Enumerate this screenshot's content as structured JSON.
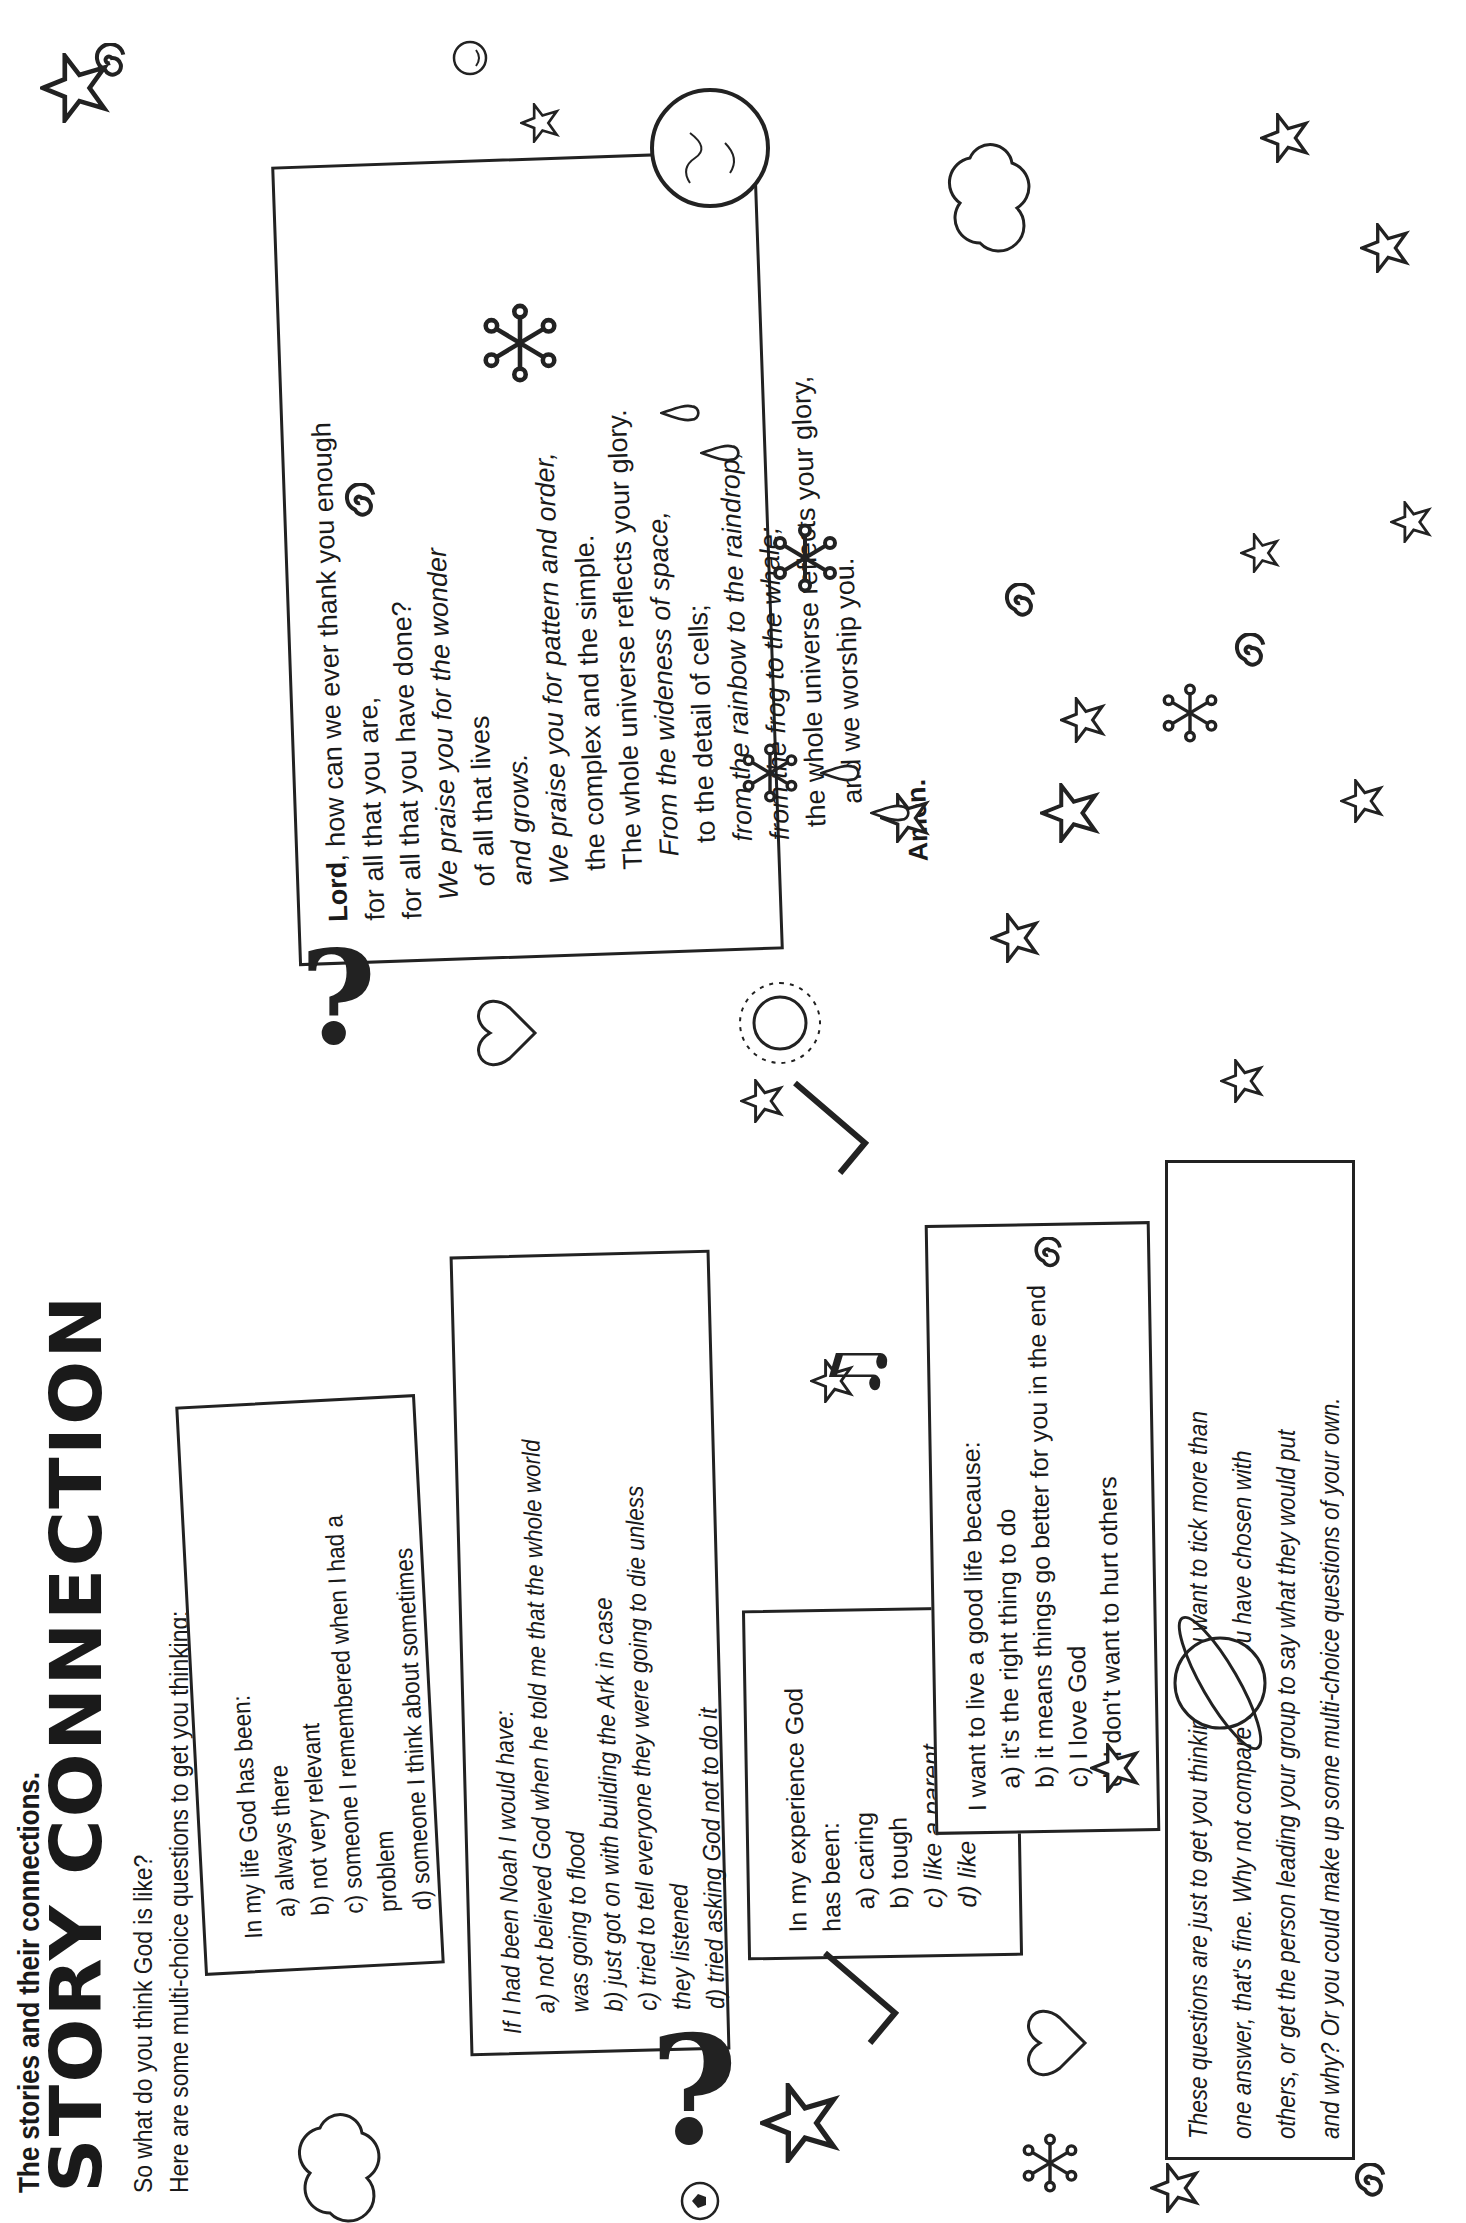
{
  "header": {
    "kicker": "The stories and their connections.",
    "title": "STORY CONNECTION",
    "intro_line1": "So what do you think God is like?",
    "intro_line2": "Here are some multi-choice questions to get you thinking:"
  },
  "questions": [
    {
      "prompt": "In my life God has been:",
      "options": [
        "a) always there",
        "b) not very relevant",
        "c) someone I remembered when I had a problem",
        "d) someone I think about sometimes"
      ]
    },
    {
      "prompt": "If I had been Noah I would have:",
      "options": [
        "a) not believed God when he told me that the whole world was going to flood",
        "b) just got on with building the Ark in case",
        "c) tried to tell everyone they were going to die unless they listened",
        "d) tried asking God not to do it"
      ]
    },
    {
      "prompt": "In my experience God has been:",
      "options": [
        "a) caring",
        "b) tough",
        "c) like a parent",
        "d) like a friend"
      ]
    },
    {
      "prompt": "I want to live a good life because:",
      "options": [
        "a) it's the right thing to do",
        "b) it means things go better for you in the end",
        "c) I love God",
        "d) I don't want to hurt others"
      ]
    }
  ],
  "note": {
    "lines": [
      "These questions are just to get you thinking. If you want to tick more than",
      "one answer, that's fine. Why not compare what you have chosen with",
      "others, or get the person leading your group to say what they would put",
      "and why? Or you could make up some multi-choice questions of your own."
    ]
  },
  "prayer": {
    "first_word": "Lord",
    "first_line_rest": ", how can we ever thank you enough",
    "lines": [
      "for all that you are,",
      "for all that you have done?",
      "We praise you for the wonder",
      "of all that lives",
      "and grows.",
      "We praise you for pattern and order,",
      "the complex and the simple.",
      "The whole universe reflects your glory.",
      "From the wideness of space,",
      "to the detail of cells;",
      "from the rainbow to the raindrop,",
      "from the frog to the whale;",
      "the whole universe reflects your glory,",
      "and we worship you."
    ],
    "closing": "Amen."
  },
  "decorations": {
    "stroke_color": "#222222",
    "icons": [
      "star-icon",
      "spiral-icon",
      "asterisk-icon",
      "raindrop-icon",
      "earth-globe-icon",
      "planet-ring-icon",
      "smiley-icon",
      "heart-icon",
      "cloud-icon",
      "question-mark-icon",
      "tick-mark-icon",
      "sun-icon",
      "music-note-icon",
      "football-icon"
    ]
  }
}
